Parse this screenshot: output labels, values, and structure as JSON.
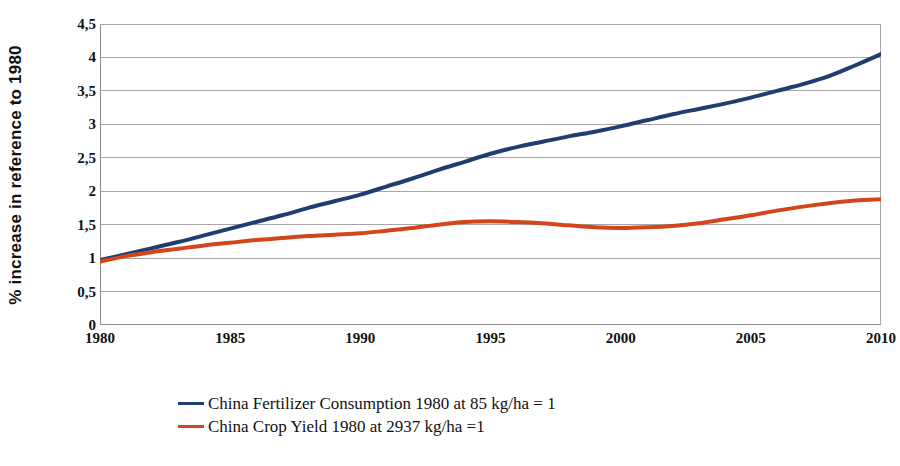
{
  "chart_data": {
    "type": "line",
    "title": "",
    "xlabel": "",
    "ylabel": "% increase in reference to 1980",
    "xlim": [
      1980,
      2010
    ],
    "ylim": [
      0,
      4.5
    ],
    "grid": true,
    "legend_position": "bottom-left",
    "x_tick_labels": [
      "1980",
      "1985",
      "1990",
      "1995",
      "2000",
      "2005",
      "2010"
    ],
    "x_ticks": [
      1980,
      1985,
      1990,
      1995,
      2000,
      2005,
      2010
    ],
    "y_tick_labels": [
      "0",
      "0,5",
      "1",
      "1,5",
      "2",
      "2,5",
      "3",
      "3,5",
      "4",
      "4,5"
    ],
    "y_ticks": [
      0,
      0.5,
      1,
      1.5,
      2,
      2.5,
      3,
      3.5,
      4,
      4.5
    ],
    "x": [
      1980,
      1981,
      1982,
      1983,
      1984,
      1985,
      1986,
      1987,
      1988,
      1989,
      1990,
      1991,
      1992,
      1993,
      1994,
      1995,
      1996,
      1997,
      1998,
      1999,
      2000,
      2001,
      2002,
      2003,
      2004,
      2005,
      2006,
      2007,
      2008,
      2009,
      2010
    ],
    "series": [
      {
        "name": "China Fertilizer Consumption 1980 at 85 kg/ha = 1",
        "color": "#1F3D6E",
        "values": [
          0.97,
          1.06,
          1.15,
          1.24,
          1.34,
          1.44,
          1.54,
          1.64,
          1.75,
          1.85,
          1.95,
          2.07,
          2.19,
          2.32,
          2.44,
          2.56,
          2.66,
          2.74,
          2.82,
          2.89,
          2.97,
          3.06,
          3.15,
          3.23,
          3.31,
          3.4,
          3.5,
          3.6,
          3.72,
          3.88,
          4.05
        ]
      },
      {
        "name": "China Crop Yield 1980 at 2937 kg/ha =1",
        "color": "#D2461A",
        "values": [
          0.95,
          1.03,
          1.09,
          1.14,
          1.19,
          1.23,
          1.27,
          1.3,
          1.33,
          1.35,
          1.37,
          1.41,
          1.45,
          1.5,
          1.54,
          1.55,
          1.54,
          1.52,
          1.49,
          1.46,
          1.45,
          1.46,
          1.48,
          1.52,
          1.58,
          1.64,
          1.71,
          1.77,
          1.82,
          1.86,
          1.88
        ]
      }
    ]
  },
  "legend": {
    "entries": [
      {
        "label": "China Fertilizer Consumption 1980 at 85 kg/ha = 1",
        "color": "#1F3D6E"
      },
      {
        "label": "China Crop Yield 1980 at 2937 kg/ha =1",
        "color": "#D2461A"
      }
    ]
  },
  "axis": {
    "y_title": "% increase in reference to 1980"
  }
}
